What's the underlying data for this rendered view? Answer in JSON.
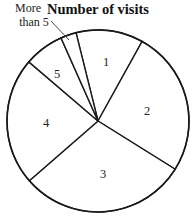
{
  "chart_data": {
    "type": "pie",
    "title": "Number of visits",
    "categories": [
      "1",
      "2",
      "3",
      "4",
      "5",
      "More than 5"
    ],
    "values": [
      12,
      26,
      30,
      23,
      7,
      3
    ],
    "units": "percent (estimated from slice angles)",
    "slice_angles_deg": [
      43,
      93,
      107,
      81.5,
      25.5,
      10
    ],
    "start_angle_deg": 346,
    "direction": "clockwise",
    "legend": "none; slices labeled inline",
    "annotations": [
      {
        "text": "More than 5",
        "line1": "More",
        "line2": "than 5",
        "leader_line": true
      }
    ]
  },
  "geometry": {
    "cx": 98,
    "cy": 121,
    "r": 91,
    "label_positions": [
      [
        106,
        66
      ],
      [
        147,
        115
      ],
      [
        103,
        178
      ],
      [
        46,
        127
      ],
      [
        57,
        78
      ]
    ]
  }
}
